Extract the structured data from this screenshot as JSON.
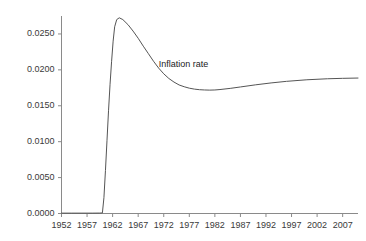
{
  "chart_data": {
    "type": "line",
    "title": "",
    "subtitle": "",
    "xlabel": "",
    "ylabel": "",
    "xlim": [
      1952,
      2010
    ],
    "ylim": [
      0.0,
      0.0275
    ],
    "grid": false,
    "legend_position": "inline-annotation",
    "x_ticks": [
      1952,
      1957,
      1962,
      1967,
      1972,
      1977,
      1982,
      1987,
      1992,
      1997,
      2002,
      2007
    ],
    "x_tick_labels": [
      "1952",
      "1957",
      "1962",
      "1967",
      "1972",
      "1977",
      "1982",
      "1987",
      "1992",
      "1997",
      "2002",
      "2007"
    ],
    "y_ticks": [
      0.0,
      0.005,
      0.01,
      0.015,
      0.02,
      0.025
    ],
    "y_tick_labels": [
      "0.0000",
      "0.0050",
      "0.0100",
      "0.0150",
      "0.0200",
      "0.0250"
    ],
    "annotations": [
      {
        "text": "Inflation rate",
        "x": 1971.0,
        "y": 0.0207
      }
    ],
    "series": [
      {
        "name": "Inflation rate",
        "color": "#555555",
        "x": [
          1952.0,
          1954.0,
          1956.0,
          1958.0,
          1959.5,
          1960.0,
          1960.3,
          1960.6,
          1960.9,
          1961.2,
          1961.5,
          1961.8,
          1962.1,
          1962.4,
          1962.8,
          1963.3,
          1964.0,
          1965.0,
          1966.0,
          1967.0,
          1968.0,
          1969.0,
          1970.0,
          1971.0,
          1972.0,
          1973.0,
          1974.0,
          1975.0,
          1976.0,
          1977.0,
          1978.0,
          1979.0,
          1980.0,
          1981.0,
          1982.0,
          1983.0,
          1985.0,
          1987.0,
          1990.0,
          1993.0,
          1996.0,
          2000.0,
          2004.0,
          2007.0,
          2010.0
        ],
        "y": [
          5e-05,
          5e-05,
          5e-05,
          5e-05,
          6e-05,
          8e-05,
          0.0022,
          0.006,
          0.0102,
          0.0143,
          0.018,
          0.0212,
          0.024,
          0.026,
          0.027,
          0.02725,
          0.027,
          0.0263,
          0.0254,
          0.0244,
          0.0233,
          0.02225,
          0.0212,
          0.02025,
          0.01945,
          0.0188,
          0.0183,
          0.0179,
          0.01765,
          0.01745,
          0.01732,
          0.01724,
          0.0172,
          0.01718,
          0.0172,
          0.01726,
          0.01742,
          0.01762,
          0.01792,
          0.01818,
          0.0184,
          0.01862,
          0.01876,
          0.01882,
          0.01886
        ]
      }
    ]
  },
  "axis": {
    "axis_color": "#8a8a8a",
    "tick_color": "#8a8a8a",
    "label_color": "#3a3a3a"
  }
}
